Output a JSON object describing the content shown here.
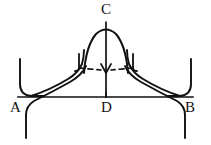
{
  "figure": {
    "type": "line-diagram",
    "background_color": "#ffffff",
    "stroke_color": "#111111",
    "baseline_color": "#4a4a4a",
    "labels": [
      {
        "id": "A",
        "text": "A",
        "x": 10,
        "y": 100,
        "role": "left-baseline-endpoint"
      },
      {
        "id": "B",
        "text": "B",
        "x": 185,
        "y": 100,
        "role": "right-baseline-endpoint"
      },
      {
        "id": "C",
        "text": "C",
        "x": 101,
        "y": 2,
        "role": "apex"
      },
      {
        "id": "D",
        "text": "D",
        "x": 101,
        "y": 100,
        "role": "baseline-midpoint"
      }
    ],
    "geometry": {
      "baseline": {
        "x1": 18,
        "y1": 97,
        "x2": 193,
        "y2": 97
      },
      "axis": {
        "x": 106,
        "y1": 22,
        "y2": 97,
        "arrow": "down",
        "arrow_y": 70
      },
      "bell": {
        "apex_x": 106,
        "apex_y": 30,
        "left_x": 84,
        "right_x": 128,
        "base_y": 68
      },
      "tick_left": {
        "x": 79,
        "y1": 55,
        "y2": 70
      },
      "tick_right": {
        "x": 133,
        "y1": 55,
        "y2": 70
      },
      "dash_left": {
        "x1": 82,
        "y1": 67,
        "x2": 100,
        "y2": 71
      },
      "dash_right": {
        "x1": 130,
        "y1": 67,
        "x2": 112,
        "y2": 71
      }
    }
  }
}
